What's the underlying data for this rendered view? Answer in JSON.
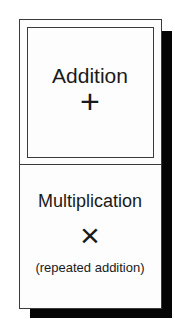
{
  "diagram": {
    "top_box": {
      "title": "Addition",
      "symbol": "+",
      "symbol_name": "plus-icon"
    },
    "bottom_box": {
      "title": "Multiplication",
      "symbol": "×",
      "symbol_name": "times-icon",
      "subtitle": "(repeated addition)"
    },
    "colors": {
      "border": "#3a3a3a",
      "shadow": "#050505",
      "background": "#fdfdfd",
      "text": "#1a1a1a"
    }
  }
}
